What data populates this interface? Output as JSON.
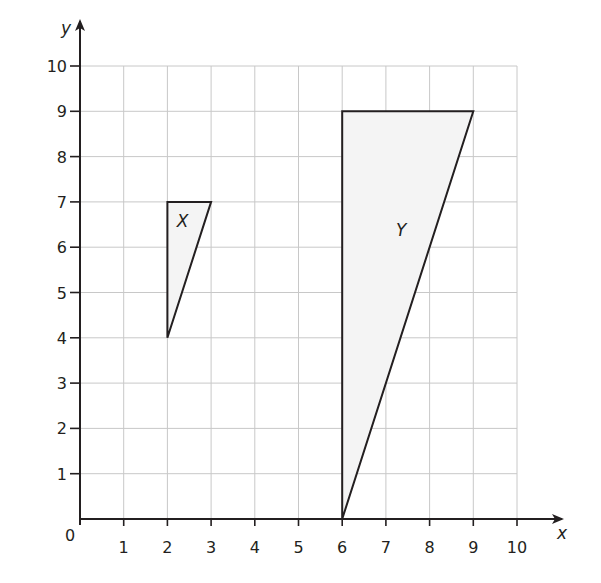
{
  "axes": {
    "x_label": "x",
    "y_label": "y",
    "origin_label": "0",
    "x_ticks": [
      "1",
      "2",
      "3",
      "4",
      "5",
      "6",
      "7",
      "8",
      "9",
      "10"
    ],
    "y_ticks": [
      "1",
      "2",
      "3",
      "4",
      "5",
      "6",
      "7",
      "8",
      "9",
      "10"
    ],
    "x_range": [
      0,
      10
    ],
    "y_range": [
      0,
      10
    ],
    "grid": true
  },
  "shapes": [
    {
      "name": "X",
      "label": "X",
      "vertices": [
        [
          2,
          7
        ],
        [
          3,
          7
        ],
        [
          2,
          4
        ]
      ],
      "label_pos": [
        2.35,
        6.45
      ]
    },
    {
      "name": "Y",
      "label": "Y",
      "vertices": [
        [
          6,
          9
        ],
        [
          9,
          9
        ],
        [
          6,
          0
        ]
      ],
      "label_pos": [
        7.35,
        6.25
      ]
    }
  ],
  "colors": {
    "axis": "#231f20",
    "grid": "#c8c8c8",
    "shape_stroke": "#231f20",
    "shape_fill": "#f4f4f4"
  }
}
